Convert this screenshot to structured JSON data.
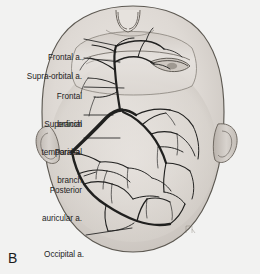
{
  "figure": {
    "panel_letter": "B",
    "view": "infant head viewed from above, face at top",
    "background_color": "#f2f2f1",
    "ink_color": "#2a2a2a",
    "skin_color": "#ded9d4"
  },
  "labels": [
    {
      "id": "frontal-a",
      "text": "Frontal a.",
      "text2": "",
      "x": 40,
      "y": 34,
      "lead_to_x": 118,
      "lead_to_y": 46
    },
    {
      "id": "supra-orbital-a",
      "text": "Supra-orbital a.",
      "text2": "",
      "x": 16,
      "y": 53,
      "lead_to_x": 120,
      "lead_to_y": 62
    },
    {
      "id": "frontal-branch",
      "text": "Frontal",
      "text2": "branch",
      "x": 54,
      "y": 76,
      "lead_to_x": 124,
      "lead_to_y": 88
    },
    {
      "id": "superficial-temporal-a",
      "text": "Superficial",
      "text2": "temporal a.",
      "x": 38,
      "y": 104,
      "lead_to_x": 113,
      "lead_to_y": 115
    },
    {
      "id": "parietal-branch",
      "text": "Parietal",
      "text2": "branch",
      "x": 52,
      "y": 133,
      "lead_to_x": 120,
      "lead_to_y": 138
    },
    {
      "id": "posterior-auricular-a",
      "text": "Posterior",
      "text2": "auricular a.",
      "x": 30,
      "y": 171,
      "lead_to_x": 92,
      "lead_to_y": 174
    },
    {
      "id": "occipital-a",
      "text": "Occipital a.",
      "text2": "",
      "x": 38,
      "y": 231,
      "lead_to_x": 130,
      "lead_to_y": 228
    }
  ],
  "arteries": [
    {
      "name": "Frontal a.",
      "region": "anterior scalp, midline forehead"
    },
    {
      "name": "Supra-orbital a.",
      "region": "above the orbit, anterolateral forehead"
    },
    {
      "name": "Frontal branch",
      "region": "frontal branch of superficial temporal artery"
    },
    {
      "name": "Superficial temporal a.",
      "region": "main trunk, preauricular, thickest vessel"
    },
    {
      "name": "Parietal branch",
      "region": "parietal branch of superficial temporal artery"
    },
    {
      "name": "Posterior auricular a.",
      "region": "behind the ear, lateral scalp"
    },
    {
      "name": "Occipital a.",
      "region": "posterior scalp, occiput"
    }
  ]
}
